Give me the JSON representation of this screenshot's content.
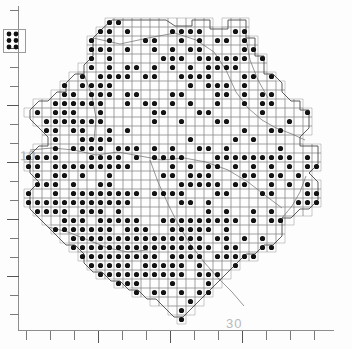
{
  "figure": {
    "kind": "distribution-atlas-map",
    "background_color": "#ffffff",
    "dot_color": "#121212",
    "grid_color": "#8a8a8a",
    "boundary_color": "#6b6b6b",
    "axis_color": "#8e8e8e"
  },
  "axes": {
    "y_axis": {
      "name": "vertical-scale",
      "labels": [
        "10"
      ],
      "label_positions": [
        {
          "value": "10",
          "y_px": 154
        }
      ],
      "tick_count": 17,
      "tick_spacing_px": 19,
      "major_ticks": [
        2,
        5,
        8,
        11,
        14
      ],
      "orientation": "left"
    },
    "x_axis": {
      "name": "horizontal-scale",
      "labels": [
        "30"
      ],
      "label_positions": [
        {
          "value": "30",
          "x_px": 235
        }
      ],
      "tick_count": 13,
      "tick_spacing_px": 24,
      "major_ticks": [
        3,
        6,
        9
      ],
      "orientation": "bottom"
    }
  },
  "map": {
    "grid_cell_px": 9,
    "grid_origin": {
      "x": 24,
      "y": 18
    },
    "inset": {
      "name": "detached-island-inset",
      "x": 3,
      "y": 29,
      "width": 21,
      "height": 22,
      "dot_rows": 3,
      "dot_columns": 2
    }
  },
  "chart_data": {
    "type": "scatter",
    "title": "",
    "xlabel": "",
    "ylabel": "",
    "note": "Presence/absence grid. Each filled marker = one occupied grid square.",
    "grid_pitch_px": 9,
    "occupied_density_by_band": [
      {
        "band": "north",
        "y_range_px": [
          18,
          90
        ],
        "fill_ratio": 0.42
      },
      {
        "band": "upper-mid",
        "y_range_px": [
          90,
          155
        ],
        "fill_ratio": 0.33
      },
      {
        "band": "centre",
        "y_range_px": [
          155,
          215
        ],
        "fill_ratio": 0.48
      },
      {
        "band": "lower-mid",
        "y_range_px": [
          215,
          275
        ],
        "fill_ratio": 0.55
      },
      {
        "band": "south",
        "y_range_px": [
          275,
          325
        ],
        "fill_ratio": 0.26
      }
    ]
  }
}
